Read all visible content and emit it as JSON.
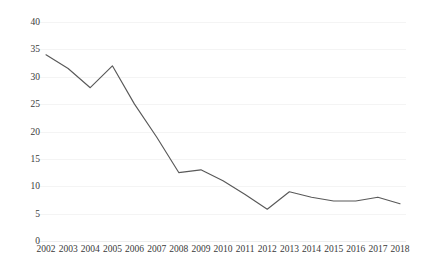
{
  "chart_data": {
    "type": "line",
    "title": "",
    "subtitle": "",
    "xlabel": "",
    "ylabel": "",
    "categories": [
      "2002",
      "2003",
      "2004",
      "2005",
      "2006",
      "2007",
      "2008",
      "2009",
      "2010",
      "2011",
      "2012",
      "2013",
      "2014",
      "2015",
      "2016",
      "2017",
      "2018"
    ],
    "values": [
      34,
      31.5,
      28,
      32,
      25,
      19,
      12.5,
      13,
      11,
      8.5,
      5.8,
      9,
      8,
      7.3,
      7.3,
      8,
      6.8
    ],
    "series": [
      {
        "name": "",
        "values": [
          34,
          31.5,
          28,
          32,
          25,
          19,
          12.5,
          13,
          11,
          8.5,
          5.8,
          9,
          8,
          7.3,
          7.3,
          8,
          6.8
        ],
        "color": "#595959"
      }
    ],
    "ylim": [
      0,
      40
    ],
    "yticks": [
      0,
      5,
      10,
      15,
      20,
      25,
      30,
      35,
      40
    ],
    "ytick_labels": [
      "0",
      "5",
      "10",
      "15",
      "20",
      "25",
      "30",
      "35",
      "40"
    ],
    "grid": true,
    "grid_axis": "y",
    "legend": false,
    "legend_position": "none",
    "markers": false,
    "line_color": "#595959",
    "grid_color": "#f4f4f4",
    "baseline_color": "#ededed",
    "text_color": "#3a3a3a",
    "background": "#ffffff"
  }
}
